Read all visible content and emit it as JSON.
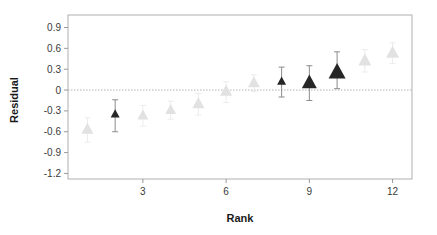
{
  "chart_data": {
    "type": "scatter",
    "title": "",
    "xlabel": "Rank",
    "ylabel": "Residual",
    "xlim": [
      0.3,
      12.7
    ],
    "ylim": [
      -1.28,
      1.08
    ],
    "xticks": [
      3,
      6,
      9,
      12
    ],
    "xtick_labels": [
      "3",
      "6",
      "9",
      "12"
    ],
    "yticks": [
      0.9,
      0.6,
      0.3,
      0,
      -0.3,
      -0.6,
      -0.9,
      -1.2
    ],
    "ytick_labels": [
      "0.9",
      "0.6",
      "0.3",
      "0",
      "-0.3",
      "-0.6",
      "-0.9",
      "-1.2"
    ],
    "grid": false,
    "reference_line": {
      "y": 0,
      "style": "dotted",
      "color": "#b4b4b4"
    },
    "marker": "triangle-up",
    "legend": null,
    "colors": {
      "highlight": "#262626",
      "muted": "#e2e2e2",
      "axis": "#9a9a9a",
      "text": "#2a2a2a",
      "errorbar_highlight": "#8c8c8c",
      "errorbar_muted": "#ececec"
    },
    "x": [
      1,
      2,
      3,
      4,
      5,
      6,
      7,
      8,
      9,
      10,
      11,
      12
    ],
    "values": [
      -0.57,
      -0.35,
      -0.37,
      -0.29,
      -0.2,
      -0.02,
      0.1,
      0.12,
      0.1,
      0.25,
      0.42,
      0.53
    ],
    "err_low": [
      -0.75,
      -0.6,
      -0.52,
      -0.42,
      -0.36,
      -0.18,
      -0.02,
      -0.1,
      -0.15,
      0.02,
      0.26,
      0.38
    ],
    "err_high": [
      -0.4,
      -0.14,
      -0.22,
      -0.16,
      -0.05,
      0.12,
      0.22,
      0.33,
      0.35,
      0.55,
      0.58,
      0.68
    ],
    "highlighted": [
      false,
      true,
      false,
      false,
      false,
      false,
      false,
      true,
      true,
      true,
      false,
      false
    ],
    "marker_sizes": [
      12,
      9,
      11,
      11,
      12,
      12,
      12,
      9,
      15,
      17,
      13,
      13
    ]
  },
  "figure": {
    "background": "#ffffff",
    "frame_color": "#b0b0b0"
  }
}
